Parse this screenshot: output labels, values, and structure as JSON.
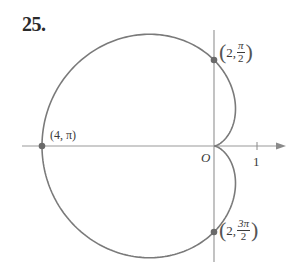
{
  "problem": {
    "number": "25."
  },
  "chart_data": {
    "type": "line",
    "subtype": "polar",
    "equation": "r = 2 - 2cos(theta)",
    "title": "",
    "xlabel": "",
    "ylabel": "",
    "curve": "cardioid",
    "axes": {
      "origin_label": "O",
      "x_tick": {
        "value": 1,
        "label": "1"
      },
      "x_range": [
        -4.4,
        1.65
      ],
      "y_range": [
        -2.65,
        2.7
      ],
      "grid": false,
      "arrow": "positive-x"
    },
    "labeled_points": [
      {
        "r": 2,
        "theta": "π/2",
        "x": 0,
        "y": 2,
        "label_r": "2",
        "label_theta_num": "π",
        "label_theta_den": "2"
      },
      {
        "r": 4,
        "theta": "π",
        "x": -4,
        "y": 0,
        "label_r": "4",
        "label_theta": "π"
      },
      {
        "r": 2,
        "theta": "3π/2",
        "x": 0,
        "y": -2,
        "label_r": "2",
        "label_theta_num": "3π",
        "label_theta_den": "2"
      }
    ],
    "style": {
      "curve_color": "#7a7a7a",
      "axis_color": "#9a9a9a",
      "point_color": "#6a6a6a"
    },
    "layout": {
      "origin_px": [
        214,
        146
      ],
      "px_per_unit": 43
    }
  },
  "labels": {
    "origin": "O",
    "tick_one": "1",
    "p1": {
      "open": "(",
      "r": "2,",
      "num": "π",
      "den": "2",
      "close": ")"
    },
    "p2": {
      "text": "(4, π)"
    },
    "p3": {
      "open": "(",
      "r": "2,",
      "num": "3π",
      "den": "2",
      "close": ")"
    }
  }
}
